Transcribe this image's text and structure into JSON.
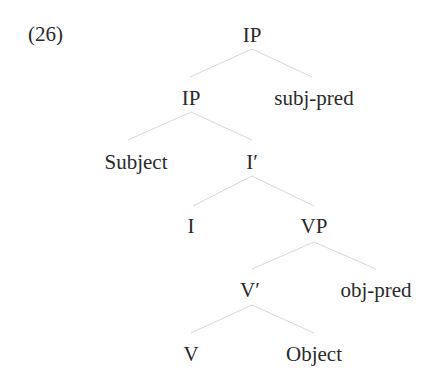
{
  "example_number": "(26)",
  "tree": {
    "nodes": [
      {
        "id": "ip_root",
        "label": "IP",
        "x": 252,
        "y": 35
      },
      {
        "id": "ip_inner",
        "label": "IP",
        "x": 191,
        "y": 98
      },
      {
        "id": "subj_pred",
        "label": "subj-pred",
        "x": 314,
        "y": 98
      },
      {
        "id": "subject",
        "label": "Subject",
        "x": 136,
        "y": 162
      },
      {
        "id": "i_bar",
        "label": "I′",
        "x": 252,
        "y": 162
      },
      {
        "id": "i_head",
        "label": "I",
        "x": 191,
        "y": 226
      },
      {
        "id": "vp",
        "label": "VP",
        "x": 314,
        "y": 226
      },
      {
        "id": "v_bar",
        "label": "V′",
        "x": 250,
        "y": 290
      },
      {
        "id": "obj_pred",
        "label": "obj-pred",
        "x": 376,
        "y": 290
      },
      {
        "id": "v_head",
        "label": "V",
        "x": 191,
        "y": 354
      },
      {
        "id": "object",
        "label": "Object",
        "x": 314,
        "y": 354
      }
    ],
    "edges": [
      [
        "ip_root",
        "ip_inner"
      ],
      [
        "ip_root",
        "subj_pred"
      ],
      [
        "ip_inner",
        "subject"
      ],
      [
        "ip_inner",
        "i_bar"
      ],
      [
        "i_bar",
        "i_head"
      ],
      [
        "i_bar",
        "vp"
      ],
      [
        "vp",
        "v_bar"
      ],
      [
        "vp",
        "obj_pred"
      ],
      [
        "v_bar",
        "v_head"
      ],
      [
        "v_bar",
        "object"
      ]
    ]
  },
  "colors": {
    "text": "#2a2a2a",
    "edge": "#d8d8d8"
  }
}
